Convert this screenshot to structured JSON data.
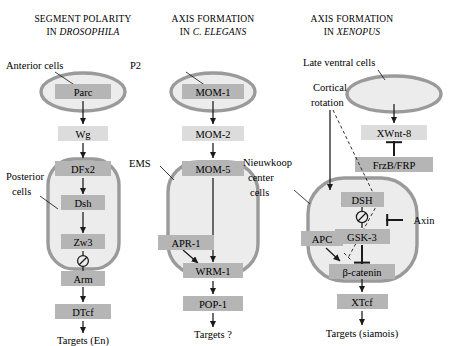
{
  "figure": {
    "panels": [
      {
        "id": "drosophila",
        "title_line1": "SEGMENT POLARITY",
        "title_line2_prefix": "IN ",
        "title_line2_italic": "DROSOPHILA",
        "cell_labels": [
          {
            "name": "anterior-cells-label",
            "text": "Anterior cells"
          },
          {
            "name": "posterior-cells-label-line1",
            "text": "Posterior"
          },
          {
            "name": "posterior-cells-label-line2",
            "text": "cells"
          }
        ],
        "nodes": [
          {
            "name": "node-parc",
            "label": "Parc",
            "shade": "dark"
          },
          {
            "name": "node-wg",
            "label": "Wg",
            "shade": "light"
          },
          {
            "name": "node-dfx2",
            "label": "DFx2",
            "shade": "dark"
          },
          {
            "name": "node-dsh",
            "label": "Dsh",
            "shade": "dark"
          },
          {
            "name": "node-zw3",
            "label": "Zw3",
            "shade": "dark"
          },
          {
            "name": "node-arm",
            "label": "Arm",
            "shade": "dark"
          },
          {
            "name": "node-dtcf",
            "label": "DTcf",
            "shade": "dark"
          }
        ],
        "target": "Targets (En)"
      },
      {
        "id": "celegans",
        "title_line1": "AXIS FORMATION",
        "title_line2_prefix": "IN ",
        "title_line2_italic": "C. ELEGANS",
        "cell_labels": [
          {
            "name": "p2-label",
            "text": "P2"
          },
          {
            "name": "ems-label",
            "text": "EMS"
          }
        ],
        "nodes": [
          {
            "name": "node-mom1",
            "label": "MOM-1",
            "shade": "dark"
          },
          {
            "name": "node-mom2",
            "label": "MOM-2",
            "shade": "light"
          },
          {
            "name": "node-mom5",
            "label": "MOM-5",
            "shade": "dark"
          },
          {
            "name": "node-apr1",
            "label": "APR-1",
            "shade": "dark"
          },
          {
            "name": "node-wrm1",
            "label": "WRM-1",
            "shade": "dark"
          },
          {
            "name": "node-pop1",
            "label": "POP-1",
            "shade": "dark"
          }
        ],
        "target": "Targets ?"
      },
      {
        "id": "xenopus",
        "title_line1": "AXIS FORMATION",
        "title_line2_prefix": "IN ",
        "title_line2_italic": "XENOPUS",
        "cell_labels": [
          {
            "name": "late-ventral-cells-label",
            "text": "Late ventral cells"
          },
          {
            "name": "cortical-rotation-label-line1",
            "text": "Cortical"
          },
          {
            "name": "cortical-rotation-label-line2",
            "text": "rotation"
          },
          {
            "name": "nieuwkoop-label-line1",
            "text": "Nieuwkoop"
          },
          {
            "name": "nieuwkoop-label-line2",
            "text": "center"
          },
          {
            "name": "nieuwkoop-label-line3",
            "text": "cells"
          }
        ],
        "nodes": [
          {
            "name": "node-xwnt8",
            "label": "XWnt-8",
            "shade": "light"
          },
          {
            "name": "node-frzb",
            "label": "FrzB/FRP",
            "shade": "dark"
          },
          {
            "name": "node-dsh-upper",
            "label": "DSH",
            "shade": "dark"
          },
          {
            "name": "node-gsk3",
            "label": "GSK-3",
            "shade": "dark"
          },
          {
            "name": "node-axin",
            "label": "Axin",
            "shade": "none"
          },
          {
            "name": "node-apc",
            "label": "APC",
            "shade": "dark"
          },
          {
            "name": "node-bcatenin",
            "label": "β-catenin",
            "shade": "dark"
          },
          {
            "name": "node-xtcf",
            "label": "XTcf",
            "shade": "dark"
          }
        ],
        "target": "Targets (siamois)"
      }
    ]
  },
  "style": {
    "cell_fill": "#ececec",
    "cell_stroke": "#9a9a9a",
    "box_dark": "#b5b5b5",
    "box_light": "#dcdcdc",
    "ink": "#1a1a1a",
    "background": "#ffffff"
  }
}
